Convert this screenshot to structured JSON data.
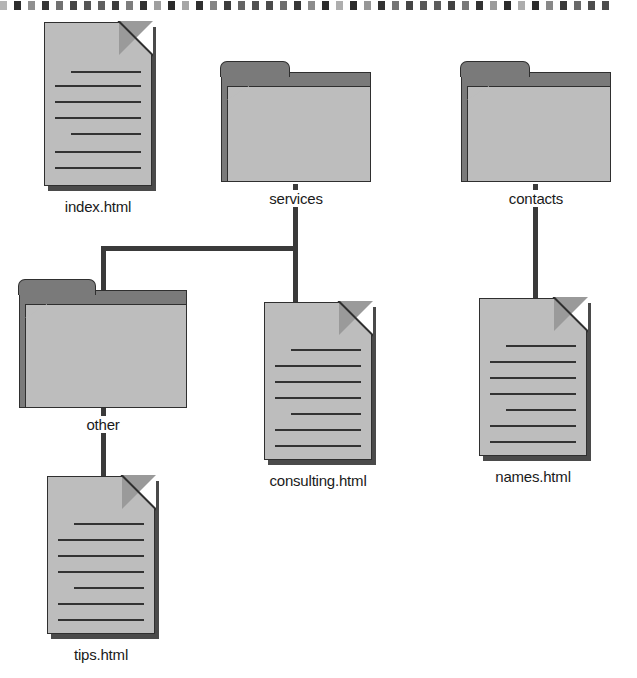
{
  "diagram": {
    "type": "site-map-tree",
    "colors": {
      "page_background": "#ffffff",
      "icon_light_gray": "#bdbdbd",
      "icon_dark_gray": "#7a7a7a",
      "outline": "#2f2f2f",
      "connector": "#3a3a3a",
      "label_text": "#1a1a1a",
      "binding_dot": "#2b2b2b"
    },
    "binding_dot_count": 44,
    "nodes": [
      {
        "id": "index",
        "label": "index.html",
        "icon": "document-icon",
        "level": 0,
        "x": 100,
        "y": 24,
        "w": 104,
        "h": 160
      },
      {
        "id": "services",
        "label": "services",
        "icon": "folder-icon",
        "level": 0,
        "x": 296,
        "y": 74,
        "w": 150,
        "h": 110
      },
      {
        "id": "contacts",
        "label": "contacts",
        "icon": "folder-icon",
        "level": 0,
        "x": 535,
        "y": 74,
        "w": 150,
        "h": 110
      },
      {
        "id": "other",
        "label": "other",
        "icon": "folder-icon",
        "level": 1,
        "x": 103,
        "y": 292,
        "w": 168,
        "h": 118
      },
      {
        "id": "consulting",
        "label": "consulting.html",
        "icon": "document-icon",
        "level": 1,
        "x": 320,
        "y": 296,
        "w": 110,
        "h": 158
      },
      {
        "id": "names",
        "label": "names.html",
        "icon": "document-icon",
        "level": 1,
        "x": 535,
        "y": 292,
        "w": 110,
        "h": 158
      },
      {
        "id": "tips",
        "label": "tips.html",
        "icon": "document-icon",
        "level": 2,
        "x": 103,
        "y": 470,
        "w": 110,
        "h": 158
      }
    ],
    "edges": [
      {
        "from": "services",
        "to": "other",
        "style": "elbow-left"
      },
      {
        "from": "services",
        "to": "consulting",
        "style": "straight-down"
      },
      {
        "from": "contacts",
        "to": "names",
        "style": "straight-down"
      },
      {
        "from": "other",
        "to": "tips",
        "style": "straight-down"
      }
    ]
  }
}
